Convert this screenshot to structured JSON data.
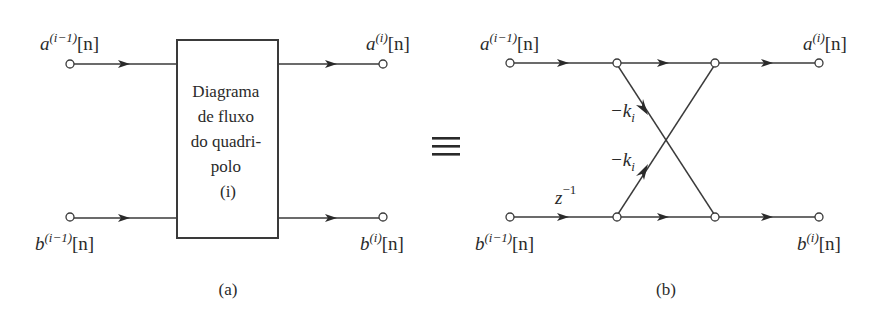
{
  "figure_a": {
    "caption": "(a)",
    "inputs": {
      "top": {
        "base": "a",
        "sup": "(i−1)",
        "arg": "[n]"
      },
      "bottom": {
        "base": "b",
        "sup": "(i−1)",
        "arg": "[n]"
      }
    },
    "outputs": {
      "top": {
        "base": "a",
        "sup": "(i)",
        "arg": "[n]"
      },
      "bottom": {
        "base": "b",
        "sup": "(i)",
        "arg": "[n]"
      }
    },
    "box_lines": [
      "Diagrama",
      "de fluxo",
      "do quadri-",
      "polo",
      "(i)"
    ]
  },
  "equivalence_symbol": "≡",
  "figure_b": {
    "caption": "(b)",
    "inputs": {
      "top": {
        "base": "a",
        "sup": "(i−1)",
        "arg": "[n]"
      },
      "bottom": {
        "base": "b",
        "sup": "(i−1)",
        "arg": "[n]"
      }
    },
    "outputs": {
      "top": {
        "base": "a",
        "sup": "(i)",
        "arg": "[n]"
      },
      "bottom": {
        "base": "b",
        "sup": "(i)",
        "arg": "[n]"
      }
    },
    "delay": {
      "base": "z",
      "sup": "−1"
    },
    "coefficients": {
      "top_to_bottom": {
        "base": "−k",
        "sub": "i"
      },
      "bottom_to_top": {
        "base": "−k",
        "sub": "i"
      }
    }
  }
}
